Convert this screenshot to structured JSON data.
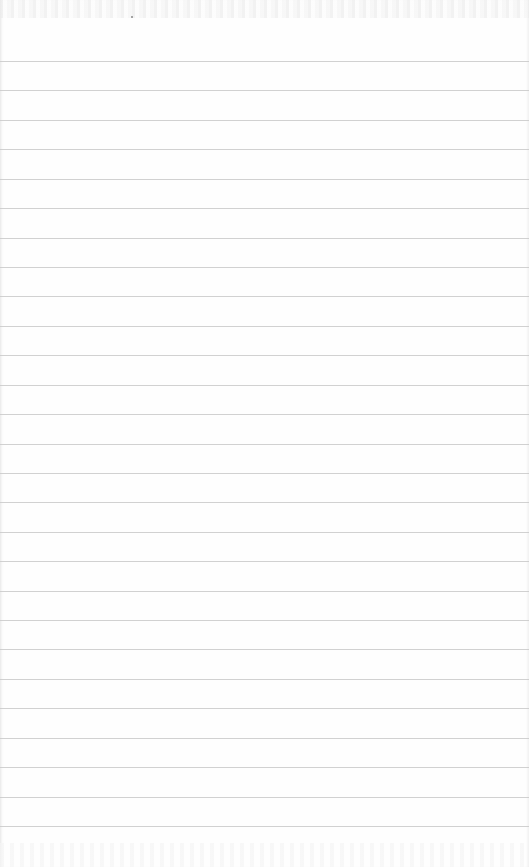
{
  "page": {
    "type": "lined-notepad-sheet",
    "line_count": 27,
    "line_color": "#c9c9c9",
    "paper_color": "#fefefe",
    "text": ""
  }
}
